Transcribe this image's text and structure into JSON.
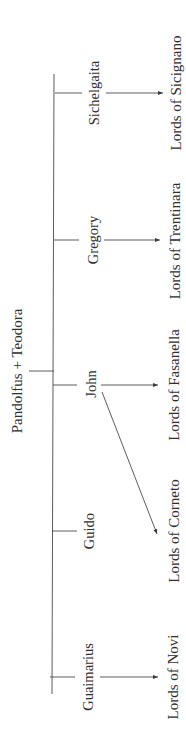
{
  "diagram": {
    "type": "genealogy",
    "orientation": "rotated-90-ccw",
    "parents": "Pandolfus + Teodora",
    "children": [
      {
        "name": "Sichelgaita",
        "descendants": [
          "Lords of Sicignano"
        ]
      },
      {
        "name": "Gregory",
        "descendants": [
          "Lords of Trentinara"
        ]
      },
      {
        "name": "John",
        "descendants": [
          "Lords of Fasanella",
          "Lords of Corneto"
        ]
      },
      {
        "name": "Guido",
        "descendants": []
      },
      {
        "name": "Guaimarius",
        "descendants": [
          "Lords of Novi"
        ]
      }
    ],
    "line_color": "#4a4a4a",
    "text_color": "#2e2e2e"
  }
}
